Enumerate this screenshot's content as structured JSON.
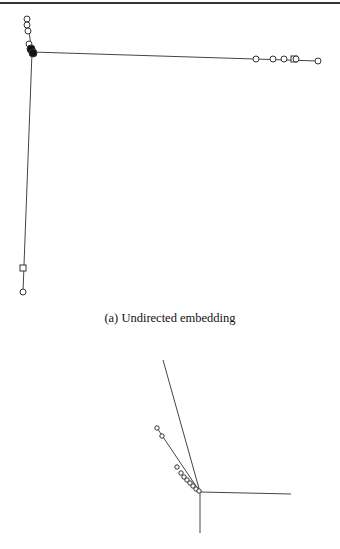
{
  "figure": {
    "panels": [
      {
        "id": "a",
        "caption": "(a) Undirected embedding",
        "hub": [
          32,
          52
        ],
        "edges": [
          {
            "from": [
              32,
              52
            ],
            "to": [
              318,
              61
            ]
          },
          {
            "from": [
              32,
              52
            ],
            "to": [
              23,
              292
            ]
          },
          {
            "from": [
              32,
              52
            ],
            "to": [
              27,
              18
            ]
          }
        ],
        "nodes": [
          {
            "x": 27,
            "y": 19,
            "shape": "circle"
          },
          {
            "x": 27,
            "y": 25,
            "shape": "circle"
          },
          {
            "x": 28,
            "y": 31,
            "shape": "circle"
          },
          {
            "x": 29,
            "y": 44,
            "shape": "circle"
          },
          {
            "x": 31,
            "y": 49,
            "shape": "filled"
          },
          {
            "x": 33,
            "y": 53,
            "shape": "filled"
          },
          {
            "x": 256,
            "y": 59,
            "shape": "circle"
          },
          {
            "x": 273,
            "y": 59,
            "shape": "circle"
          },
          {
            "x": 284,
            "y": 59,
            "shape": "circle"
          },
          {
            "x": 294,
            "y": 59,
            "shape": "square"
          },
          {
            "x": 296,
            "y": 59,
            "shape": "circle"
          },
          {
            "x": 318,
            "y": 61,
            "shape": "circle"
          },
          {
            "x": 23,
            "y": 268,
            "shape": "square"
          },
          {
            "x": 23,
            "y": 292,
            "shape": "circle"
          }
        ]
      },
      {
        "id": "b",
        "caption": "",
        "hub": [
          200,
          492
        ],
        "edges": [
          {
            "from": [
              200,
              492
            ],
            "to": [
              163,
              360
            ]
          },
          {
            "from": [
              200,
              492
            ],
            "to": [
              157,
              428
            ]
          },
          {
            "from": [
              200,
              492
            ],
            "to": [
              291,
              494
            ]
          },
          {
            "from": [
              200,
              492
            ],
            "to": [
              200,
              533
            ]
          }
        ],
        "nodes": [
          {
            "x": 157,
            "y": 428,
            "shape": "circle"
          },
          {
            "x": 162,
            "y": 436,
            "shape": "circle"
          },
          {
            "x": 177,
            "y": 467,
            "shape": "circle"
          },
          {
            "x": 181,
            "y": 473,
            "shape": "circle"
          },
          {
            "x": 184,
            "y": 477,
            "shape": "circle"
          },
          {
            "x": 187,
            "y": 480,
            "shape": "circle"
          },
          {
            "x": 190,
            "y": 483,
            "shape": "circle"
          },
          {
            "x": 193,
            "y": 486,
            "shape": "circle"
          },
          {
            "x": 196,
            "y": 489,
            "shape": "circle"
          },
          {
            "x": 199,
            "y": 491,
            "shape": "circle"
          }
        ]
      }
    ],
    "colors": {
      "line": "#444444",
      "node_stroke": "#333333",
      "node_fill": "#ffffff",
      "filled": "#111111",
      "rule": "#333333"
    }
  }
}
